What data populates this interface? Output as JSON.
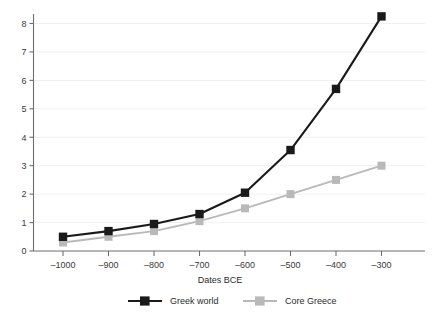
{
  "chart_data": {
    "type": "line",
    "title": "",
    "xlabel": "Dates BCE",
    "ylabel": "",
    "xlim": [
      -1050,
      -270
    ],
    "ylim": [
      0,
      8.6
    ],
    "grid": "horizontal",
    "legend_position": "bottom",
    "categories": [
      -1000,
      -900,
      -800,
      -700,
      -600,
      -500,
      -400,
      -300
    ],
    "x_tick_labels": [
      "–1000",
      "–900",
      "–800",
      "–700",
      "–600",
      "–500",
      "–400",
      "–300"
    ],
    "y_tick_labels": [
      "0",
      "1",
      "2",
      "3",
      "4",
      "5",
      "6",
      "7",
      "8"
    ],
    "y_ticks": [
      0,
      1,
      2,
      3,
      4,
      5,
      6,
      7,
      8
    ],
    "marker": "square",
    "series": [
      {
        "name": "Greek world",
        "color": "#1a1a1a",
        "values": [
          0.5,
          0.7,
          0.95,
          1.3,
          2.05,
          3.55,
          5.7,
          8.25
        ]
      },
      {
        "name": "Core Greece",
        "color": "#b9b9b9",
        "values": [
          0.3,
          0.5,
          0.7,
          1.05,
          1.5,
          2.0,
          2.5,
          3.0
        ]
      }
    ]
  },
  "legend": {
    "items": [
      {
        "label": "Greek world",
        "color": "#1a1a1a"
      },
      {
        "label": "Core Greece",
        "color": "#b9b9b9"
      }
    ]
  },
  "axes": {
    "x_title": "Dates BCE"
  },
  "colors": {
    "background": "#ffffff",
    "axis": "#6e6e6e",
    "gridline": "#f0f0f0",
    "series_primary": "#1a1a1a",
    "series_secondary": "#b9b9b9",
    "text": "#2b2b2b"
  }
}
